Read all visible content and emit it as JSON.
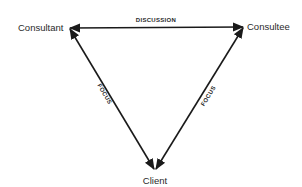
{
  "diagram": {
    "type": "triangle-relationship",
    "nodes": [
      {
        "id": "consultant",
        "label": "Consultant"
      },
      {
        "id": "consultee",
        "label": "Consultee"
      },
      {
        "id": "client",
        "label": "Client"
      }
    ],
    "edges": [
      {
        "from": "consultee",
        "to": "consultant",
        "label": "DISCUSSION",
        "arrows": "both"
      },
      {
        "from": "consultant",
        "to": "client",
        "label": "FOCUS",
        "arrows": "both"
      },
      {
        "from": "consultee",
        "to": "client",
        "label": "FOCUS",
        "arrows": "both"
      }
    ],
    "line_color": "#1a1a1a"
  }
}
